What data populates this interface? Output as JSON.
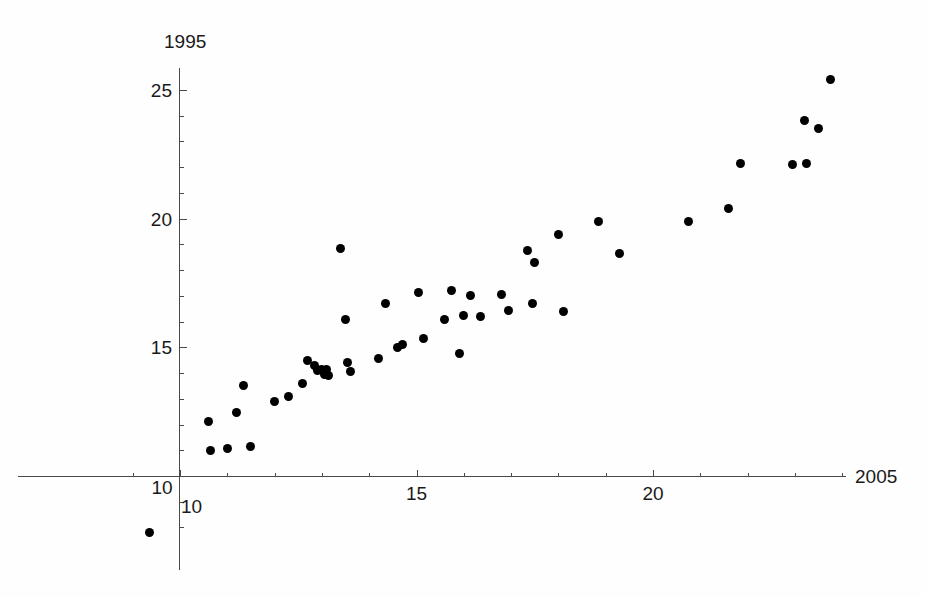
{
  "chart_data": {
    "type": "scatter",
    "title": "",
    "xlabel": "2005",
    "ylabel": "1995",
    "xlim": [
      9.3,
      24.2
    ],
    "ylim": [
      7.0,
      26.0
    ],
    "grid": false,
    "legend": null,
    "x_major_ticks": [
      10,
      15,
      20
    ],
    "x_major_tick_labels": [
      "10",
      "15",
      "20"
    ],
    "x_minor_tick_step": 1,
    "y_major_ticks": [
      10,
      15,
      20,
      25
    ],
    "y_major_tick_labels": [
      "10",
      "15",
      "20",
      "25"
    ],
    "y_minor_tick_step": 1,
    "marker": "filled-circle",
    "marker_color": "#000000",
    "axis_color": "#4a4a4a",
    "background_color": "#fefefe",
    "point_count": 53,
    "points": [
      [
        9.35,
        7.8
      ],
      [
        10.6,
        12.1
      ],
      [
        10.65,
        11.0
      ],
      [
        11.0,
        11.05
      ],
      [
        11.2,
        12.45
      ],
      [
        11.35,
        13.5
      ],
      [
        11.5,
        11.15
      ],
      [
        12.0,
        12.9
      ],
      [
        12.3,
        13.1
      ],
      [
        12.6,
        13.6
      ],
      [
        12.7,
        14.5
      ],
      [
        12.85,
        14.3
      ],
      [
        12.9,
        14.1
      ],
      [
        13.0,
        14.15
      ],
      [
        13.05,
        13.95
      ],
      [
        13.1,
        14.15
      ],
      [
        13.15,
        13.9
      ],
      [
        13.4,
        18.85
      ],
      [
        13.5,
        16.1
      ],
      [
        13.55,
        14.4
      ],
      [
        13.6,
        14.05
      ],
      [
        14.2,
        14.55
      ],
      [
        14.35,
        16.7
      ],
      [
        14.6,
        15.0
      ],
      [
        14.7,
        15.1
      ],
      [
        15.05,
        17.15
      ],
      [
        15.15,
        15.35
      ],
      [
        15.6,
        16.1
      ],
      [
        15.75,
        17.2
      ],
      [
        15.9,
        14.75
      ],
      [
        16.0,
        16.25
      ],
      [
        16.15,
        17.0
      ],
      [
        16.35,
        16.2
      ],
      [
        16.8,
        17.05
      ],
      [
        16.95,
        16.45
      ],
      [
        17.35,
        18.75
      ],
      [
        17.45,
        16.7
      ],
      [
        17.5,
        18.3
      ],
      [
        18.0,
        19.4
      ],
      [
        18.1,
        16.4
      ],
      [
        18.85,
        19.9
      ],
      [
        19.3,
        18.65
      ],
      [
        20.75,
        19.9
      ],
      [
        21.6,
        20.4
      ],
      [
        21.85,
        22.15
      ],
      [
        22.95,
        22.1
      ],
      [
        23.2,
        23.8
      ],
      [
        23.25,
        22.15
      ],
      [
        23.5,
        23.5
      ],
      [
        23.75,
        25.4
      ]
    ]
  },
  "axes": {
    "y_name": "1995",
    "x_name": "2005",
    "x_tick_labels": [
      {
        "value": 10,
        "text": "10"
      },
      {
        "value": 15,
        "text": "15"
      },
      {
        "value": 20,
        "text": "20"
      }
    ],
    "y_tick_labels": [
      {
        "value": 10,
        "text": "10"
      },
      {
        "value": 15,
        "text": "15"
      },
      {
        "value": 20,
        "text": "20"
      },
      {
        "value": 25,
        "text": "25"
      }
    ]
  }
}
